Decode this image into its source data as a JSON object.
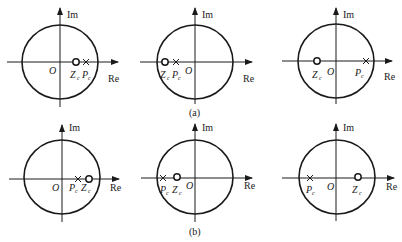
{
  "figure": {
    "groups": [
      {
        "caption": "(a)",
        "panels": [
          {
            "id": "a1",
            "im_label": "Im",
            "re_label": "Re",
            "origin_label": "O",
            "zero_label": "Z",
            "zero_sub": "c",
            "pole_label": "P",
            "pole_sub": "c",
            "zero_position": "positive real, inside unit circle, closer to origin than pole",
            "pole_position": "positive real, inside unit circle, near boundary"
          },
          {
            "id": "a2",
            "im_label": "Im",
            "re_label": "Re",
            "origin_label": "O",
            "zero_label": "Z",
            "zero_sub": "c",
            "pole_label": "P",
            "pole_sub": "c",
            "zero_position": "negative real, near unit circle",
            "pole_position": "negative real, between zero and origin"
          },
          {
            "id": "a3",
            "im_label": "Im",
            "re_label": "Re",
            "origin_label": "O",
            "zero_label": "Z",
            "zero_sub": "c",
            "pole_label": "P",
            "pole_sub": "c",
            "zero_position": "negative real, inside unit circle",
            "pole_position": "positive real, near unit circle"
          }
        ]
      },
      {
        "caption": "(b)",
        "panels": [
          {
            "id": "b1",
            "im_label": "Im",
            "re_label": "Re",
            "origin_label": "O",
            "zero_label": "Z",
            "zero_sub": "c",
            "pole_label": "P",
            "pole_sub": "c",
            "zero_position": "positive real, near unit circle",
            "pole_position": "positive real, between origin and zero"
          },
          {
            "id": "b2",
            "im_label": "Im",
            "re_label": "Re",
            "origin_label": "O",
            "zero_label": "Z",
            "zero_sub": "c",
            "pole_label": "P",
            "pole_sub": "c",
            "zero_position": "negative real, between pole and origin",
            "pole_position": "negative real, near unit circle"
          },
          {
            "id": "b3",
            "im_label": "Im",
            "re_label": "Re",
            "origin_label": "O",
            "zero_label": "Z",
            "zero_sub": "c",
            "pole_label": "P",
            "pole_sub": "c",
            "zero_position": "positive real, inside unit circle",
            "pole_position": "negative real, near unit circle"
          }
        ]
      }
    ]
  }
}
